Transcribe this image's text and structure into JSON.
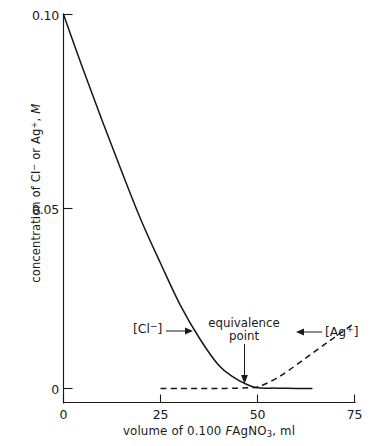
{
  "chart_data": {
    "type": "line",
    "title": "",
    "xlabel": "volume of 0.100 F AgNO3, ml",
    "ylabel": "concentration of Cl- or Ag+, M",
    "xlim": [
      0,
      75
    ],
    "ylim": [
      0,
      0.1
    ],
    "grid": false,
    "legend_position": "inline-annotations",
    "xticks": [
      "0",
      "25",
      "50",
      "75"
    ],
    "xtick_values": [
      0,
      25,
      50,
      75
    ],
    "yticks": [
      "0.10",
      "0.05",
      "0"
    ],
    "ytick_values": [
      0.1,
      0.05,
      0
    ],
    "series": [
      {
        "name": "[Cl-]",
        "style": "solid",
        "x": [
          0,
          5,
          10,
          15,
          20,
          25,
          30,
          35,
          40,
          44,
          47,
          49,
          50,
          52,
          55,
          60,
          64
        ],
        "values": [
          0.1,
          0.0855,
          0.0715,
          0.058,
          0.045,
          0.0335,
          0.0225,
          0.0135,
          0.0062,
          0.0029,
          0.0012,
          0.0004,
          0.0002,
          0.0001,
          0.0001,
          0.0,
          0.0
        ]
      },
      {
        "name": "[Ag+]",
        "style": "dashed",
        "x": [
          25,
          30,
          35,
          40,
          45,
          48,
          50,
          52,
          55,
          58,
          62,
          66,
          70,
          75
        ],
        "values": [
          0.0,
          0.0,
          0.0,
          0.0,
          0.0001,
          0.0002,
          0.0004,
          0.0012,
          0.0028,
          0.0048,
          0.0078,
          0.0108,
          0.0138,
          0.0175
        ]
      }
    ],
    "annotations": [
      {
        "text": "[Cl⁻]",
        "points_to_x": 38,
        "direction": "right"
      },
      {
        "text": "equivalence point",
        "points_to_x": 50,
        "direction": "down"
      },
      {
        "text": "[Ag⁺]",
        "points_to_x": 62,
        "direction": "left"
      }
    ]
  },
  "axes": {
    "ylabel_prefix": "concentration of Cl",
    "ylabel_cl_charge": "−",
    "ylabel_mid": " or Ag",
    "ylabel_ag_charge": "+",
    "ylabel_suffix": ", ",
    "ylabel_molar": "M",
    "xlabel_prefix": "volume of 0.100 ",
    "xlabel_formality": "F",
    "xlabel_compound": "AgNO",
    "xlabel_compound_sub": "3",
    "xlabel_unit": ", ml",
    "ytick_0": "0.10",
    "ytick_1": "0.05",
    "ytick_2": "0",
    "xtick_0": "0",
    "xtick_1": "25",
    "xtick_2": "50",
    "xtick_3": "75"
  },
  "annotations": {
    "chloride_bracket_open": "[",
    "chloride_symbol": "Cl",
    "chloride_charge": "−",
    "chloride_bracket_close": "]",
    "silver_bracket_open": "[",
    "silver_symbol": "Ag",
    "silver_charge": "+",
    "silver_bracket_close": "]",
    "equivalence_line1": "equivalence",
    "equivalence_line2": "point"
  },
  "colors": {
    "ink": "#1a1a1a",
    "curve": "#161616",
    "background": "#ffffff"
  }
}
